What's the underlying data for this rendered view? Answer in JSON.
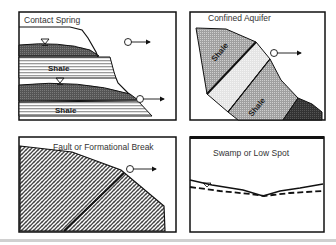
{
  "panels": {
    "contact_spring": {
      "title": "Contact Spring",
      "layers": [
        "Shale",
        "Shale"
      ]
    },
    "confined_aquifer": {
      "title": "Confined Aquifer",
      "layers": [
        "Shale",
        "Shale"
      ]
    },
    "fault_break": {
      "title": "Fault or Formational Break"
    },
    "swamp": {
      "title": "Swamp or Low Spot"
    }
  },
  "colors": {
    "border": "#111111",
    "aquifer_dark": "#4a4a4a",
    "shale_stripes": "#bdbdbd",
    "gray_fill": "#a8a8a8",
    "light_fill": "#e2e2e2",
    "dark_rock": "#3a3a3a"
  }
}
